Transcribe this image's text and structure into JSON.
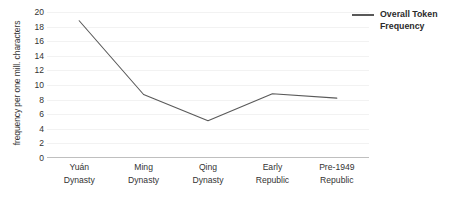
{
  "chart_data": {
    "type": "line",
    "title": "",
    "xlabel": "",
    "ylabel": "frequency per one mill. characters",
    "categories": [
      "Yuán Dynasty",
      "Ming Dynasty",
      "Qing Dynasty",
      "Early Republic",
      "Pre-1949 Republic"
    ],
    "category_lines": [
      [
        "Yuán",
        "Dynasty"
      ],
      [
        "Ming",
        "Dynasty"
      ],
      [
        "Qing",
        "Dynasty"
      ],
      [
        "Early",
        "Republic"
      ],
      [
        "Pre-1949",
        "Republic"
      ]
    ],
    "series": [
      {
        "name": "Overall Token Frequency",
        "values": [
          18.8,
          8.7,
          5.1,
          8.8,
          8.2
        ],
        "color": "#595959"
      }
    ],
    "ylim": [
      0,
      20
    ],
    "yticks": [
      0,
      2,
      4,
      6,
      8,
      10,
      12,
      14,
      16,
      18,
      20
    ],
    "ytick_labels": [
      "0",
      "2",
      "4",
      "6",
      "8",
      "10",
      "12",
      "14",
      "16",
      "18",
      "20"
    ],
    "grid": true,
    "grid_color": "#f2f2f2",
    "axis_color": "#bfbfbf",
    "legend": {
      "position": "right",
      "entries": [
        {
          "label": "Overall Token Frequency",
          "marker": "line",
          "color": "#595959"
        }
      ]
    }
  },
  "legend": {
    "label_line1": "Overall Token",
    "label_line2": "Frequency"
  }
}
